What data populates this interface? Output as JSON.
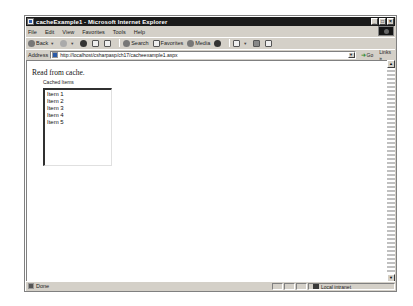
{
  "window": {
    "title": "cacheExample1 - Microsoft Internet Explorer",
    "controls": [
      "_",
      "□",
      "×"
    ]
  },
  "menubar": {
    "items": [
      "File",
      "Edit",
      "View",
      "Favorites",
      "Tools",
      "Help"
    ]
  },
  "toolbar": {
    "back_label": "Back",
    "search_label": "Search",
    "favorites_label": "Favorites",
    "media_label": "Media"
  },
  "addressbar": {
    "label": "Address",
    "url": "http://localhost/csharpasp/ch17/cacheexample1.aspx",
    "go_label": "Go",
    "links_label": "Links"
  },
  "page": {
    "heading": "Read from cache.",
    "list_label": "Cached Items",
    "items": [
      "Item 1",
      "Item 2",
      "Item 3",
      "Item 4",
      "Item 5"
    ]
  },
  "statusbar": {
    "status": "Done",
    "zone": "Local intranet"
  },
  "icons": {
    "scroll_up": "▲",
    "scroll_down": "▼",
    "dropdown": "▼",
    "back_arrow": "▼",
    "go_arrow": "➜",
    "links_more": "»"
  }
}
